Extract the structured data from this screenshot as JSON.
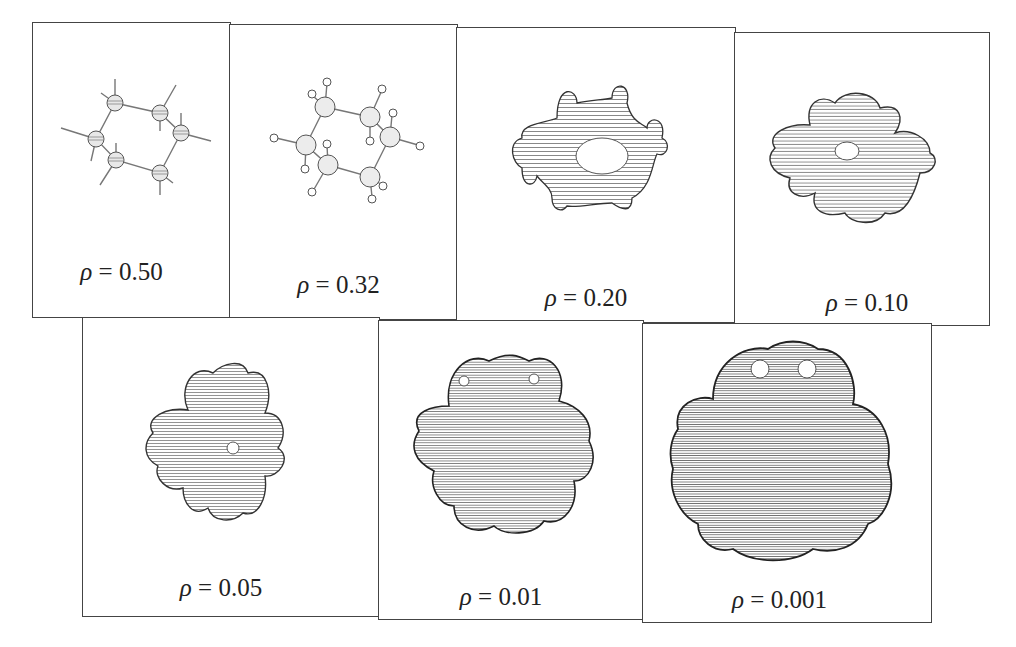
{
  "figure": {
    "panels": [
      {
        "symbol": "ρ",
        "eq": " = ",
        "value": "0.50",
        "depiction": "ball-and-stick skeleton"
      },
      {
        "symbol": "ρ",
        "eq": " = ",
        "value": "0.32",
        "depiction": "atoms with hydrogen spheres"
      },
      {
        "symbol": "ρ",
        "eq": " = ",
        "value": "0.20",
        "depiction": "ring-shaped isosurface with hole"
      },
      {
        "symbol": "ρ",
        "eq": " = ",
        "value": "0.10",
        "depiction": "connected isosurface, small hole"
      },
      {
        "symbol": "ρ",
        "eq": " = ",
        "value": "0.05",
        "depiction": "merged isosurface, pinhole"
      },
      {
        "symbol": "ρ",
        "eq": " = ",
        "value": "0.01",
        "depiction": "closed lobed isosurface"
      },
      {
        "symbol": "ρ",
        "eq": " = ",
        "value": "0.001",
        "depiction": "large smooth isosurface"
      }
    ]
  }
}
